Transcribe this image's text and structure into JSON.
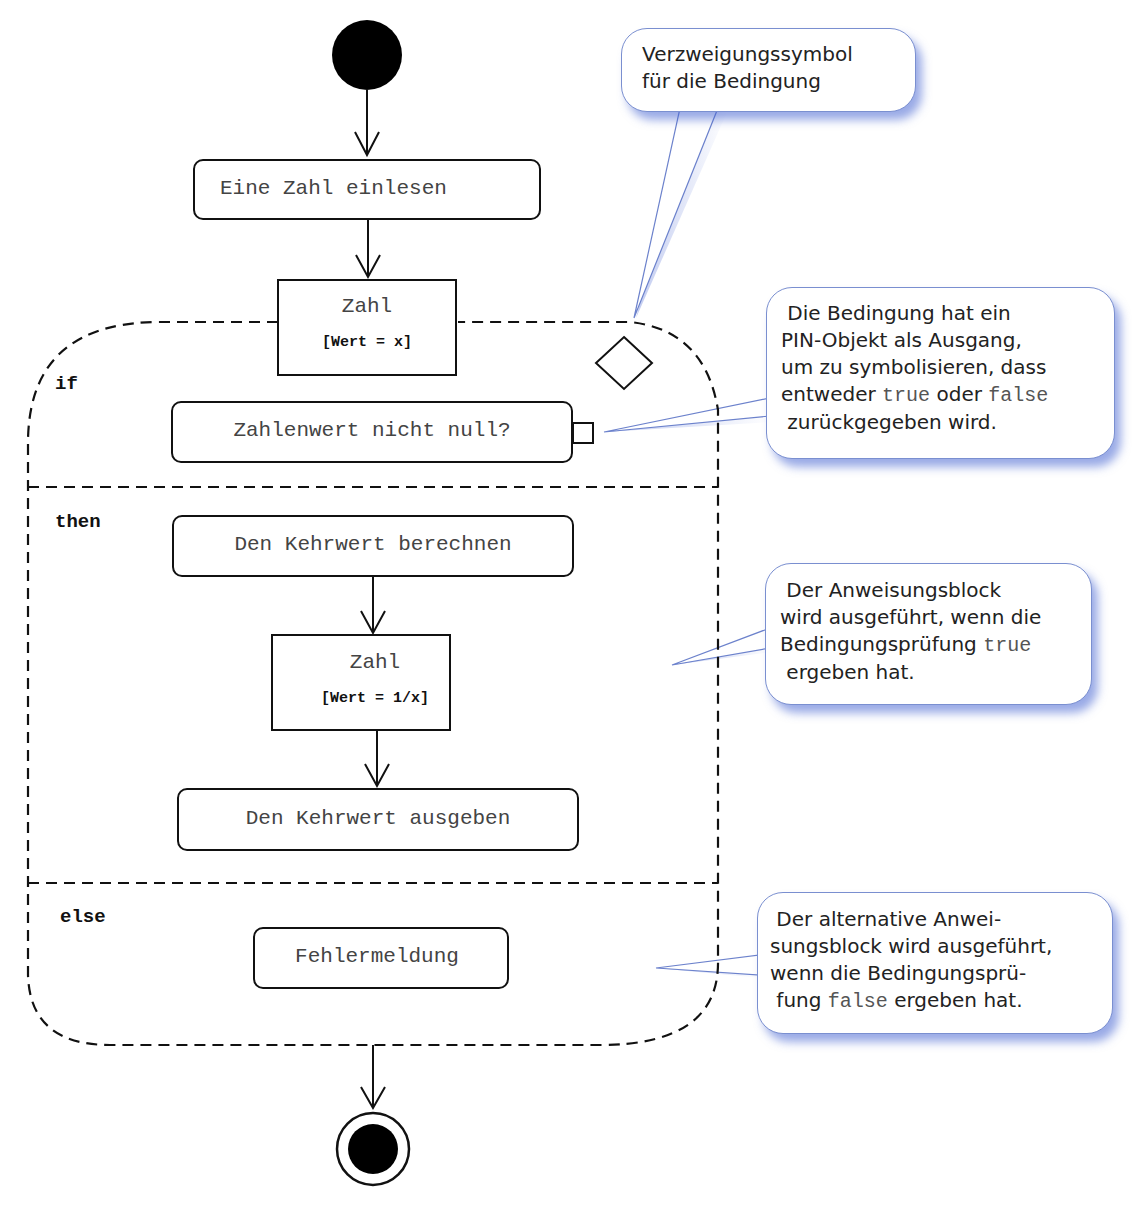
{
  "diagram": {
    "type": "UML activity diagram (if-then-else conditional node)",
    "nodes": {
      "read_number": "Eine Zahl einlesen",
      "pin1_name": "Zahl",
      "pin1_guard": "[Wert = x]",
      "condition": "Zahlenwert nicht null?",
      "compute": "Den Kehrwert berechnen",
      "pin2_name": "Zahl",
      "pin2_guard": "[Wert = 1/x]",
      "output": "Den Kehrwert ausgeben",
      "error": "Fehlermeldung"
    },
    "sections": {
      "if": "if",
      "then": "then",
      "else": "else"
    }
  },
  "callouts": {
    "branch_symbol": {
      "line1": "Verzweigungssymbol",
      "line2": "für die Bedingung"
    },
    "pin_output": {
      "line1": "Die Bedingung hat ein",
      "line2": "PIN-Objekt als Ausgang,",
      "line3": "um zu symbolisieren, dass",
      "line4_pre": "entweder ",
      "line4_true": "true",
      "line4_mid": " oder ",
      "line4_false": "false",
      "line5": "zurückgegeben wird."
    },
    "then_block": {
      "line1": "Der Anweisungsblock",
      "line2": "wird ausgeführt, wenn die",
      "line3_pre": "Bedingungsprüfung ",
      "line3_true": "true",
      "line4": "ergeben hat."
    },
    "else_block": {
      "line1": "Der alternative Anwei-",
      "line2": "sungsblock wird ausgeführt,",
      "line3": "wenn die Bedingungsprü-",
      "line4_pre": "fung ",
      "line4_false": "false",
      "line4_post": " ergeben hat."
    }
  },
  "colors": {
    "callout_border": "#7a8fd0",
    "callout_shadow": "#4664d2",
    "stroke": "#111111"
  }
}
